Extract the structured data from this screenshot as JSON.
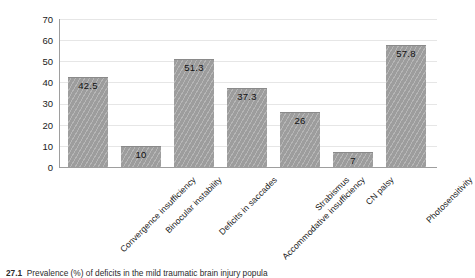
{
  "chart_data": {
    "type": "bar",
    "title": "",
    "xlabel": "",
    "ylabel": "",
    "ylim": [
      0,
      70
    ],
    "ytick_step": 10,
    "yticks": [
      "70",
      "60",
      "50",
      "40",
      "30",
      "20",
      "10",
      "0"
    ],
    "grid": true,
    "legend": "none",
    "bar_color": "#9d9d9d",
    "bar_pattern": "diagonal-hatch",
    "categories": [
      "Convergence insufficiency",
      "Binocular instability",
      "Deficits in saccades",
      "Accommodative insufficiency",
      "Strabismus",
      "CN palsy",
      "Photosensitivity"
    ],
    "values": [
      42.5,
      10,
      51.3,
      37.3,
      26,
      7,
      57.8
    ],
    "value_labels": [
      "42.5",
      "10",
      "51.3",
      "37.3",
      "26",
      "7",
      "57.8"
    ]
  },
  "caption": {
    "figure_number": "27.1",
    "text": "Prevalence (%) of deficits in the mild traumatic brain injury popula"
  }
}
